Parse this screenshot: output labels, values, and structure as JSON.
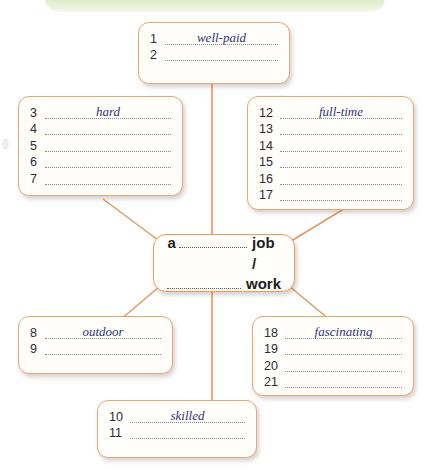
{
  "page": {
    "banner_color": "#dceac6",
    "box_border_color": "#e8a778",
    "center_border_color": "#ef9d5e",
    "answer_ink_color": "#2e3470"
  },
  "center": {
    "name": "central-prompt",
    "lead": "a",
    "tail_1": "job /",
    "tail_2": "work"
  },
  "boxes": [
    {
      "id": "top",
      "name": "answers-box-top",
      "rows": [
        {
          "num": "1",
          "answer": "well-paid"
        },
        {
          "num": "2",
          "answer": ""
        }
      ]
    },
    {
      "id": "left-upper",
      "name": "answers-box-left-upper",
      "rows": [
        {
          "num": "3",
          "answer": "hard"
        },
        {
          "num": "4",
          "answer": ""
        },
        {
          "num": "5",
          "answer": ""
        },
        {
          "num": "6",
          "answer": ""
        },
        {
          "num": "7",
          "answer": ""
        }
      ]
    },
    {
      "id": "right-upper",
      "name": "answers-box-right-upper",
      "rows": [
        {
          "num": "12",
          "answer": "full-time"
        },
        {
          "num": "13",
          "answer": ""
        },
        {
          "num": "14",
          "answer": ""
        },
        {
          "num": "15",
          "answer": ""
        },
        {
          "num": "16",
          "answer": ""
        },
        {
          "num": "17",
          "answer": ""
        }
      ]
    },
    {
      "id": "left-lower",
      "name": "answers-box-left-lower",
      "rows": [
        {
          "num": "8",
          "answer": "outdoor"
        },
        {
          "num": "9",
          "answer": ""
        }
      ]
    },
    {
      "id": "right-lower",
      "name": "answers-box-right-lower",
      "rows": [
        {
          "num": "18",
          "answer": "fascinating"
        },
        {
          "num": "19",
          "answer": ""
        },
        {
          "num": "20",
          "answer": ""
        },
        {
          "num": "21",
          "answer": ""
        }
      ]
    },
    {
      "id": "bottom",
      "name": "answers-box-bottom",
      "rows": [
        {
          "num": "10",
          "answer": "skilled"
        },
        {
          "num": "11",
          "answer": ""
        }
      ]
    }
  ]
}
